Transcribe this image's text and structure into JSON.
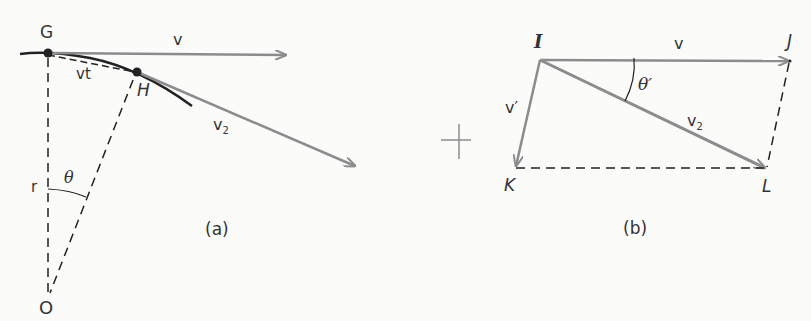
{
  "panel_a": {
    "caption": "(a)",
    "points": {
      "G": {
        "label": "G",
        "x": 48,
        "y": 53
      },
      "H": {
        "label": "H",
        "x": 137,
        "y": 72
      },
      "O": {
        "label": "O",
        "x": 48,
        "y": 295
      }
    },
    "labels": {
      "v": "v",
      "vt": "vt",
      "v2_main": "v",
      "v2_sub": "2",
      "r": "r",
      "theta": "θ"
    }
  },
  "operator": {
    "symbol": "+"
  },
  "panel_b": {
    "caption": "(b)",
    "points": {
      "I": {
        "label": "I",
        "x": 540,
        "y": 60
      },
      "J": {
        "label": "J",
        "x": 790,
        "y": 61
      },
      "K": {
        "label": "K",
        "x": 515,
        "y": 167
      },
      "L": {
        "label": "L",
        "x": 766,
        "y": 168
      }
    },
    "labels": {
      "v": "v",
      "v_prime": "v′",
      "v2_main": "v",
      "v2_sub": "2",
      "theta_prime": "θ′"
    }
  },
  "colors": {
    "vector": "#8c8c8c",
    "ink": "#222222",
    "background": "#fbfbfa"
  }
}
